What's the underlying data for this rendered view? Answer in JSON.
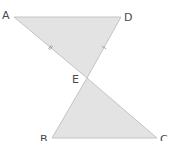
{
  "diagram": {
    "type": "geometry",
    "fill_color": "#e3e3e3",
    "stroke_color": "#c4c4c4",
    "points": {
      "A": {
        "label": "A",
        "x": 14,
        "y": 17
      },
      "D": {
        "label": "D",
        "x": 121,
        "y": 17
      },
      "E": {
        "label": "E",
        "x": 87,
        "y": 78
      },
      "B": {
        "label": "B",
        "x": 52,
        "y": 138
      },
      "C": {
        "label": "C",
        "x": 157,
        "y": 138
      }
    },
    "triangles": [
      {
        "name": "ADE",
        "vertices": [
          "A",
          "D",
          "E"
        ]
      },
      {
        "name": "BCE",
        "vertices": [
          "B",
          "C",
          "E"
        ]
      }
    ],
    "tick_marks": [
      {
        "segment": "AE",
        "count": 2
      },
      {
        "segment": "DE",
        "count": 1
      }
    ]
  }
}
